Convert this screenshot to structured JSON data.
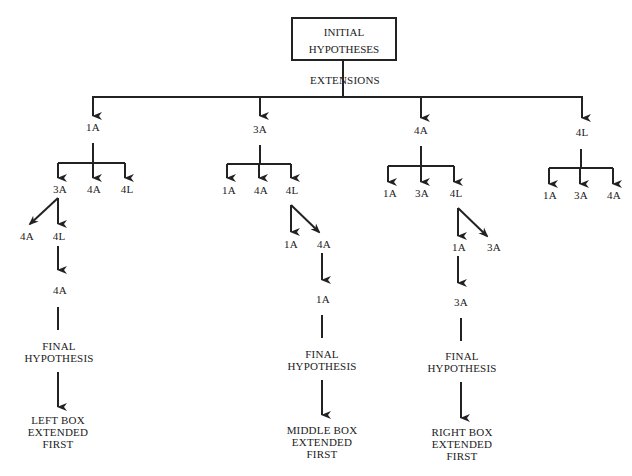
{
  "root": {
    "line1": "INITIAL",
    "line2": "HYPOTHESES"
  },
  "edge_label": "EXTENSIONS",
  "branches": [
    {
      "label": "1A",
      "children": [
        "3A",
        "4A",
        "4L"
      ],
      "sub": {
        "parent": "3A",
        "children": [
          "4A",
          "4L"
        ]
      },
      "chain": [
        "4A"
      ],
      "final": "FINAL HYPOTHESIS",
      "final_l1": "FINAL",
      "final_l2": "HYPOTHESIS",
      "outcome": [
        "LEFT BOX",
        "EXTENDED",
        "FIRST"
      ]
    },
    {
      "label": "3A",
      "children": [
        "1A",
        "4A",
        "4L"
      ],
      "sub": {
        "parent": "4L",
        "children": [
          "1A",
          "4A"
        ]
      },
      "chain": [
        "1A"
      ],
      "final_l1": "FINAL",
      "final_l2": "HYPOTHESIS",
      "outcome": [
        "MIDDLE BOX",
        "EXTENDED",
        "FIRST"
      ]
    },
    {
      "label": "4A",
      "children": [
        "1A",
        "3A",
        "4L"
      ],
      "sub": {
        "parent": "4L",
        "children": [
          "1A",
          "3A"
        ]
      },
      "chain": [
        "3A"
      ],
      "final_l1": "FINAL",
      "final_l2": "HYPOTHESIS",
      "outcome": [
        "RIGHT BOX",
        "EXTENDED",
        "FIRST"
      ]
    },
    {
      "label": "4L",
      "children": [
        "1A",
        "3A",
        "4A"
      ]
    }
  ],
  "colors": {
    "line": "#222222",
    "background": "#ffffff"
  }
}
